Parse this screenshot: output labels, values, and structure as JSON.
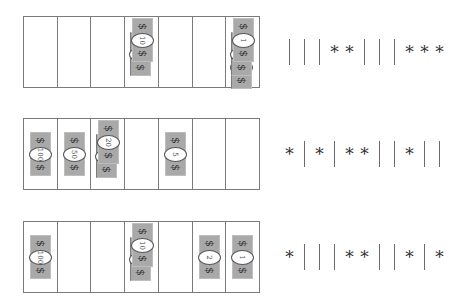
{
  "denominations": [
    "100",
    "50",
    "20",
    "10",
    "5",
    "2",
    "1"
  ],
  "currency_symbol": "$",
  "symbols": {
    "star": "*",
    "bar": "|"
  },
  "rows": [
    {
      "counts": [
        0,
        0,
        0,
        2,
        0,
        0,
        3
      ],
      "sequence": "|||**|||***",
      "tokens": [
        "|",
        "|",
        "|",
        "*",
        "*",
        "|",
        "|",
        "|",
        "*",
        "*",
        "*"
      ]
    },
    {
      "counts": [
        1,
        1,
        2,
        0,
        1,
        0,
        0
      ],
      "sequence": "*|*|**||*||",
      "tokens": [
        "*",
        "|",
        "*",
        "|",
        "*",
        "*",
        "|",
        "|",
        "*",
        "|",
        "|"
      ]
    },
    {
      "counts": [
        1,
        0,
        0,
        2,
        0,
        1,
        1
      ],
      "sequence": "*|||**||*|*",
      "tokens": [
        "*",
        "|",
        "|",
        "|",
        "*",
        "*",
        "|",
        "|",
        "*",
        "|",
        "*"
      ]
    }
  ],
  "colors": {
    "bill": "#a9a9a9",
    "border": "#7a7a7a",
    "text": "#333333"
  }
}
